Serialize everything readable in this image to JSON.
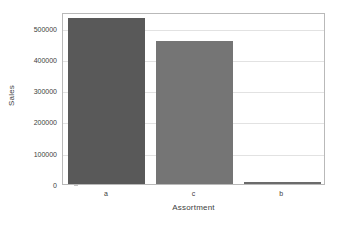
{
  "chart_data": {
    "type": "bar",
    "title": "",
    "subtitle": "",
    "xlabel": "Assortment",
    "ylabel": "Sales",
    "categories": [
      "a",
      "c",
      "b"
    ],
    "values": [
      532000,
      458000,
      7000
    ],
    "series": [
      {
        "name": "Sales",
        "values": [
          532000,
          458000,
          7000
        ]
      }
    ],
    "ylim": [
      0,
      550000
    ],
    "xlim": [
      0,
      3
    ],
    "yticks": [
      0,
      100000,
      200000,
      300000,
      400000,
      500000
    ],
    "ytick_labels": [
      "0",
      "100000",
      "200000",
      "300000",
      "400000",
      "500000"
    ],
    "xtick_labels": [
      "a",
      "c",
      "b"
    ],
    "grid": true,
    "grid_axis": "y",
    "legend": false,
    "legend_position": "none",
    "annotations": [],
    "bar_colors": [
      "#595959",
      "#757575",
      "#6b6b6b"
    ],
    "background_color": "#ffffff",
    "frame_color": "#b9b9b9",
    "gridline_color": "#e2e2e2",
    "text_color": "#3d3d3d"
  }
}
